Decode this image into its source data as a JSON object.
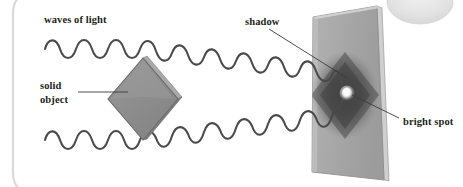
{
  "figure": {
    "type": "physics-diagram",
    "canvas": {
      "width": 463,
      "height": 187
    },
    "background_color": "#ffffff"
  },
  "labels": {
    "waves_of_light": "waves of light",
    "solid_object_line1": "solid",
    "solid_object_line2": "object",
    "shadow": "shadow",
    "bright_spot": "bright spot"
  },
  "colors": {
    "text": "#231f20",
    "leader_line": "#3b3b3b",
    "wave_stroke": "#4a4a4a",
    "object_face": "#8e8e8e",
    "object_edge": "#6f6f6f",
    "object_outline": "#6a6a6a",
    "screen_face": "#a8a8a8",
    "screen_edge": "#c9c9c9",
    "screen_outline": "#8f8f8f",
    "shadow_dark": "#4e4e4e",
    "bright_spot": "#fdfdfd",
    "page_border": "#d9d9d9",
    "lamp": "#e3e3e3"
  },
  "elements": {
    "solid_object": {
      "name": "diamond-shaped solid object",
      "shape": "rhombus",
      "center": {
        "x": 143,
        "y": 99
      },
      "half_width": 35,
      "half_height": 41
    },
    "screen": {
      "name": "projection screen",
      "shape": "tilted-rectangle",
      "corners": [
        {
          "x": 313,
          "y": 17
        },
        {
          "x": 377,
          "y": 6
        },
        {
          "x": 384,
          "y": 180
        },
        {
          "x": 312,
          "y": 172
        }
      ]
    },
    "shadow_patch": {
      "name": "diamond shadow cast on screen",
      "center": {
        "x": 345,
        "y": 95
      }
    },
    "bright_spot_dot": {
      "name": "poisson bright spot at centre of shadow",
      "center": {
        "x": 347,
        "y": 93
      },
      "radius": 5.5
    },
    "lamp": {
      "name": "light source glow top right",
      "center": {
        "x": 420,
        "y": 2
      },
      "rx": 33,
      "ry": 22
    }
  },
  "waves": {
    "top": {
      "name": "upper wave train",
      "start": {
        "x": 45,
        "y": 49
      },
      "flat_end": {
        "x": 148,
        "y": 49
      },
      "end": {
        "x": 341,
        "y": 92
      },
      "amplitude": 11,
      "wavelength": 21
    },
    "bottom": {
      "name": "lower wave train",
      "start": {
        "x": 45,
        "y": 140
      },
      "flat_end": {
        "x": 148,
        "y": 140
      },
      "end": {
        "x": 341,
        "y": 99
      },
      "amplitude": 11,
      "wavelength": 21
    }
  },
  "leader_lines": {
    "waves_of_light": {
      "from": {
        "x": 60,
        "y": 30
      },
      "to": {
        "x": 60,
        "y": 30
      }
    },
    "solid_object": {
      "from": {
        "x": 78,
        "y": 92
      },
      "to": {
        "x": 128,
        "y": 92
      }
    },
    "shadow": {
      "from": {
        "x": 269,
        "y": 29
      },
      "to": {
        "x": 347,
        "y": 78
      }
    },
    "bright_spot": {
      "from": {
        "x": 352,
        "y": 95
      },
      "to": {
        "x": 399,
        "y": 118
      }
    }
  },
  "label_positions": {
    "waves_of_light": {
      "x": 44,
      "y": 23
    },
    "solid_object_line1": {
      "x": 40,
      "y": 89
    },
    "solid_object_line2": {
      "x": 40,
      "y": 103
    },
    "shadow": {
      "x": 245,
      "y": 25
    },
    "bright_spot": {
      "x": 403,
      "y": 125
    }
  }
}
